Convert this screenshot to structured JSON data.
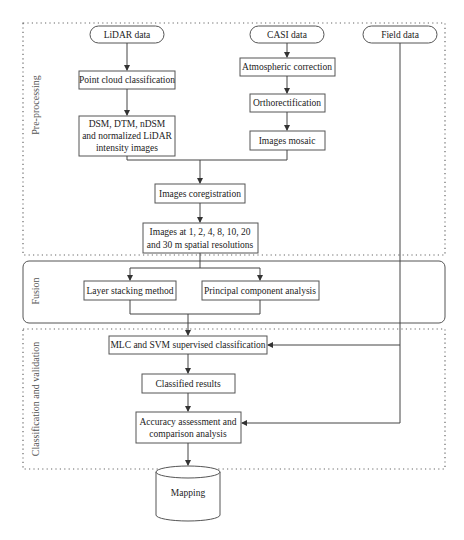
{
  "diagram": {
    "type": "flowchart",
    "sections": [
      {
        "id": "preprocessing",
        "label": "Pre-processing",
        "style": "dotted"
      },
      {
        "id": "fusion",
        "label": "Fusion",
        "style": "rounded-solid"
      },
      {
        "id": "classification",
        "label": "Classification and validation",
        "style": "dotted"
      }
    ],
    "nodes": {
      "lidar": {
        "label": "LiDAR data",
        "shape": "terminal"
      },
      "casi": {
        "label": "CASI data",
        "shape": "terminal"
      },
      "field": {
        "label": "Field data",
        "shape": "terminal"
      },
      "point_cloud": {
        "label": "Point cloud classification"
      },
      "dsm": {
        "line1": "DSM, DTM, nDSM",
        "line2": "and normalized LiDAR",
        "line3": "intensity images"
      },
      "atmos": {
        "label": "Atmospheric correction"
      },
      "ortho": {
        "label": "Orthorectification"
      },
      "mosaic": {
        "label": "Images mosaic"
      },
      "coreg": {
        "label": "Images coregistration"
      },
      "resolutions": {
        "line1": "Images at 1, 2, 4, 8, 10, 20",
        "line2": "and 30 m spatial resolutions"
      },
      "layer_stack": {
        "label": "Layer stacking method"
      },
      "pca": {
        "label": "Principal component analysis"
      },
      "mlc_svm": {
        "label": "MLC and SVM supervised classification"
      },
      "classified": {
        "label": "Classified results"
      },
      "accuracy": {
        "line1": "Accuracy assessment and",
        "line2": "comparison analysis"
      },
      "mapping": {
        "label": "Mapping",
        "shape": "cylinder"
      }
    },
    "edges": [
      [
        "lidar",
        "point_cloud"
      ],
      [
        "point_cloud",
        "dsm"
      ],
      [
        "casi",
        "atmos"
      ],
      [
        "atmos",
        "ortho"
      ],
      [
        "ortho",
        "mosaic"
      ],
      [
        "dsm",
        "coreg"
      ],
      [
        "mosaic",
        "coreg"
      ],
      [
        "coreg",
        "resolutions"
      ],
      [
        "resolutions",
        "layer_stack"
      ],
      [
        "resolutions",
        "pca"
      ],
      [
        "layer_stack",
        "mlc_svm"
      ],
      [
        "pca",
        "mlc_svm"
      ],
      [
        "field",
        "mlc_svm"
      ],
      [
        "field",
        "accuracy"
      ],
      [
        "mlc_svm",
        "classified"
      ],
      [
        "classified",
        "accuracy"
      ],
      [
        "accuracy",
        "mapping"
      ]
    ]
  }
}
